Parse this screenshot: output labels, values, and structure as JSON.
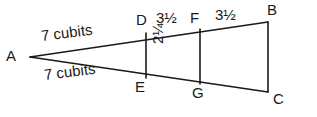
{
  "figure": {
    "type": "geometry-diagram",
    "background_color": "#ffffff",
    "stroke_color": "#1a1a1a",
    "text_color": "#1a1a1a",
    "vertices": {
      "A": "A",
      "B": "B",
      "C": "C",
      "D": "D",
      "E": "E",
      "F": "F",
      "G": "G"
    },
    "measurements": {
      "side_upper": "7 cubits",
      "side_lower": "7 cubits",
      "segment_DF": "3½",
      "segment_FB": "3½",
      "segment_DE": "2¼"
    },
    "geometry": {
      "apex_A": [
        30,
        57
      ],
      "point_B": [
        268,
        22
      ],
      "point_C": [
        268,
        92
      ],
      "point_D": [
        146,
        33
      ],
      "point_E": [
        146,
        78
      ],
      "point_F": [
        200,
        28
      ],
      "point_G": [
        200,
        85
      ],
      "stroke_width": 1.6
    }
  }
}
